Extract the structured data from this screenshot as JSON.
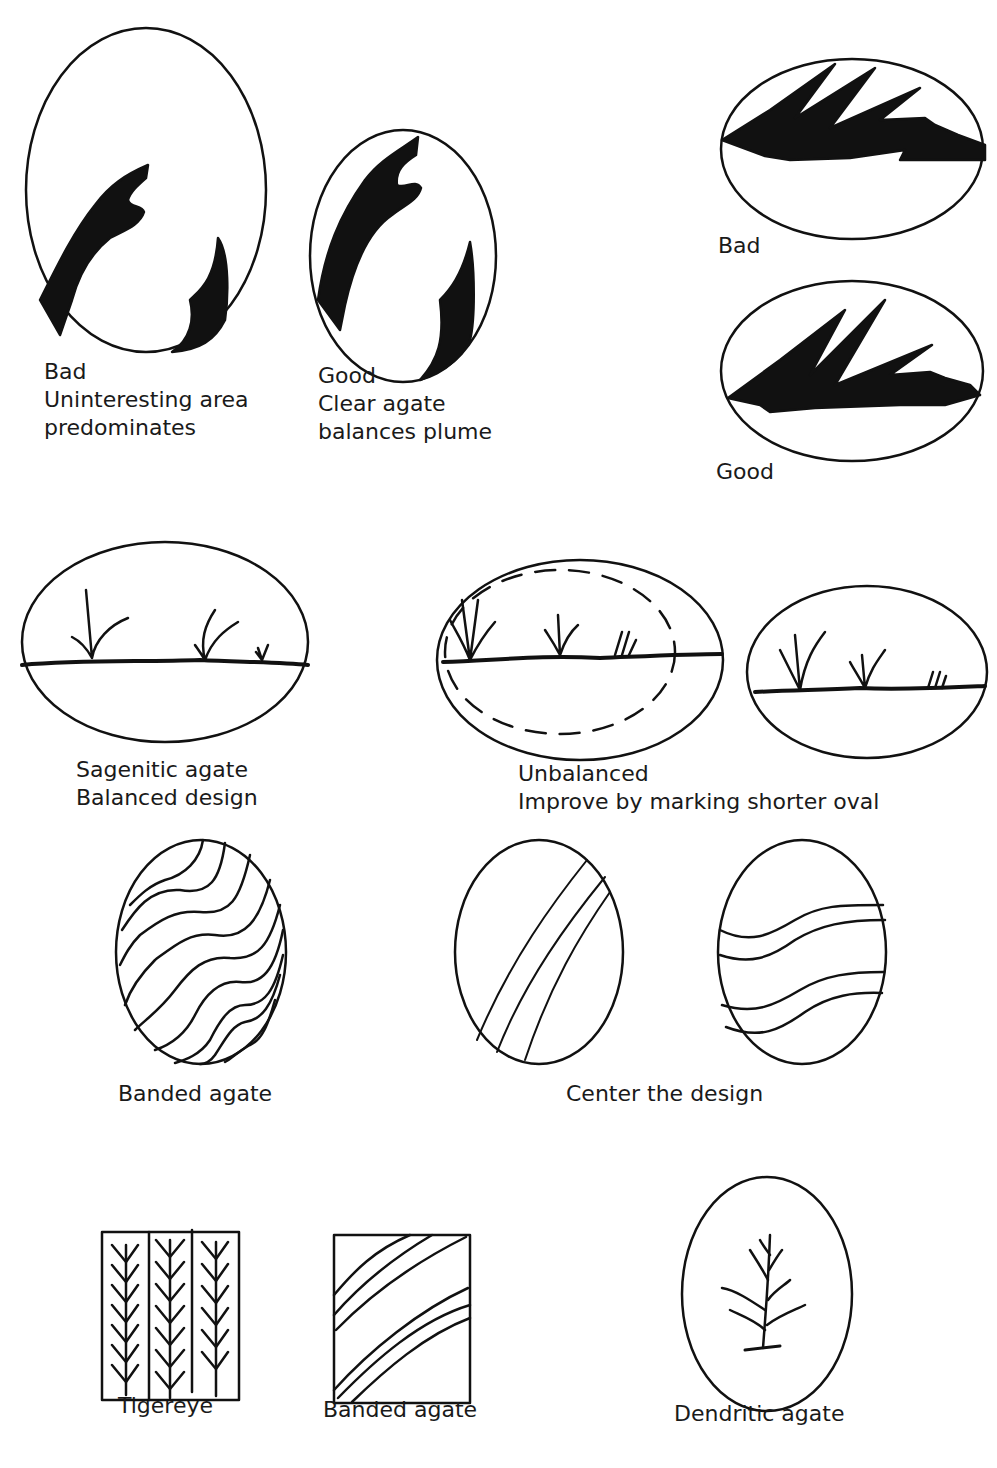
{
  "figure": {
    "colors": {
      "ink": "#111111",
      "background": "#ffffff"
    }
  },
  "sections": {
    "plume_vertical": {
      "bad": {
        "lines": [
          "Bad",
          "Uninteresting area",
          "predominates"
        ]
      },
      "good": {
        "lines": [
          "Good",
          "Clear agate",
          "balances plume"
        ]
      }
    },
    "plume_horizontal": {
      "bad": {
        "label": "Bad"
      },
      "good": {
        "label": "Good"
      }
    },
    "sagenitic": {
      "balanced": {
        "lines": [
          "Sagenitic agate",
          "Balanced design"
        ]
      },
      "unbalanced": {
        "lines": [
          "Unbalanced",
          "Improve by marking shorter oval"
        ]
      }
    },
    "banded": {
      "banded_agate": {
        "label": "Banded agate"
      },
      "center": {
        "label": "Center the design"
      }
    },
    "rectangles": {
      "tigereye": {
        "label": "Tigereye"
      },
      "banded_agate_rect": {
        "label": "Banded agate"
      },
      "dendritic": {
        "label": "Dendritic agate"
      }
    }
  }
}
